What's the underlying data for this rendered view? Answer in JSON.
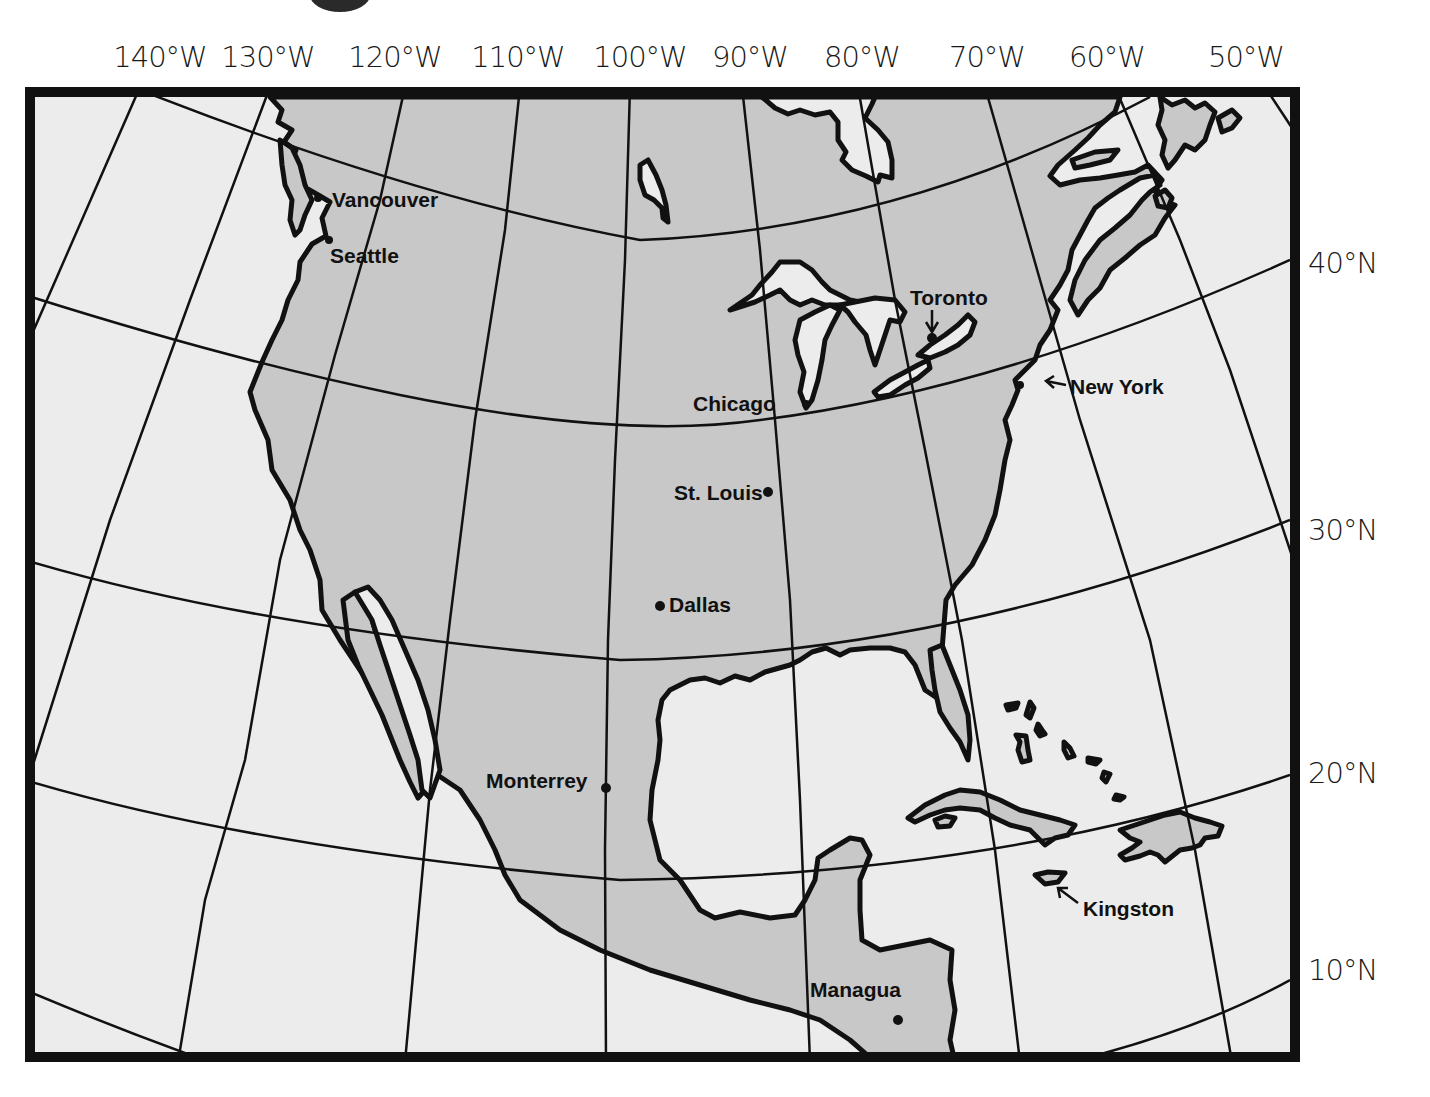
{
  "map": {
    "projection": "conic",
    "colors": {
      "land": "#c8c8c8",
      "water": "#ececec",
      "outline": "#111111",
      "frame": "#111111",
      "page": "#ffffff"
    },
    "longitude_labels": [
      {
        "label": "140°W",
        "x": 160
      },
      {
        "label": "130°W",
        "x": 268
      },
      {
        "label": "120°W",
        "x": 395
      },
      {
        "label": "110°W",
        "x": 518
      },
      {
        "label": "100°W",
        "x": 640
      },
      {
        "label": "90°W",
        "x": 750
      },
      {
        "label": "80°W",
        "x": 862
      },
      {
        "label": "70°W",
        "x": 987
      },
      {
        "label": "60°W",
        "x": 1107
      },
      {
        "label": "50°W",
        "x": 1246
      }
    ],
    "latitude_labels": [
      {
        "label": "40°N",
        "y": 263
      },
      {
        "label": "30°N",
        "y": 530
      },
      {
        "label": "20°N",
        "y": 773
      },
      {
        "label": "10°N",
        "y": 970
      }
    ],
    "cities": [
      {
        "name": "Vancouver",
        "label_x": 307,
        "label_y": 189,
        "dot_x": 318,
        "dot_y": 198
      },
      {
        "name": "Seattle",
        "label_x": 307,
        "label_y": 245,
        "dot_x": 329,
        "dot_y": 240
      },
      {
        "name": "Toronto",
        "label_x": 884,
        "label_y": 287,
        "dot_x": 932,
        "dot_y": 338,
        "arrow": "down"
      },
      {
        "name": "Chicago",
        "label_x": 668,
        "label_y": 393,
        "dot_x": 806,
        "dot_y": 404
      },
      {
        "name": "New York",
        "label_x": 1045,
        "label_y": 376,
        "dot_x": 1020,
        "dot_y": 385,
        "arrow": "left"
      },
      {
        "name": "St. Louis",
        "label_x": 651,
        "label_y": 482,
        "dot_x": 768,
        "dot_y": 492
      },
      {
        "name": "Dallas",
        "label_x": 644,
        "label_y": 594,
        "dot_x": 660,
        "dot_y": 606
      },
      {
        "name": "Monterrey",
        "label_x": 461,
        "label_y": 770,
        "dot_x": 606,
        "dot_y": 788
      },
      {
        "name": "Kingston",
        "label_x": 1059,
        "label_y": 898,
        "dot_x": 1048,
        "dot_y": 876,
        "arrow": "up-left"
      },
      {
        "name": "Managua",
        "label_x": 785,
        "label_y": 979,
        "dot_x": 898,
        "dot_y": 1020
      }
    ]
  }
}
